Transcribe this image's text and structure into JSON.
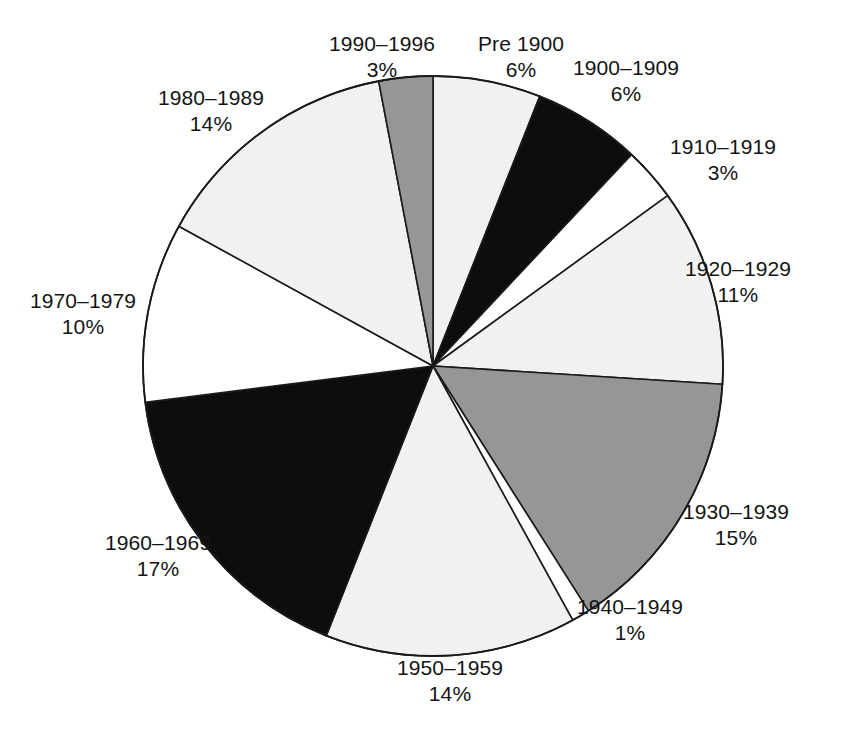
{
  "chart_data": {
    "type": "pie",
    "title": "",
    "subtitle": "",
    "xlabel": "",
    "ylabel": "",
    "legend_position": "none",
    "grid": false,
    "units": "percent",
    "start_angle_deg": 0,
    "direction": "clockwise",
    "categories": [
      "Pre 1900",
      "1900–1909",
      "1910–1919",
      "1920–1929",
      "1930–1939",
      "1940–1949",
      "1950–1959",
      "1960–1969",
      "1970–1979",
      "1980–1989",
      "1990–1996"
    ],
    "values": [
      6,
      6,
      3,
      11,
      15,
      1,
      14,
      17,
      10,
      14,
      3
    ],
    "value_labels": [
      "6%",
      "6%",
      "3%",
      "11%",
      "15%",
      "1%",
      "14%",
      "17%",
      "10%",
      "14%",
      "3%"
    ],
    "slice_colors": [
      "#f1f1ef",
      "#0d0d0d",
      "#ffffff",
      "#f1f1ef",
      "#969696",
      "#ffffff",
      "#f1f1ef",
      "#0d0d0d",
      "#ffffff",
      "#f1f1ef",
      "#969696"
    ],
    "slice_outline_color": "#1a1a1a",
    "slices": [
      {
        "label": "Pre 1900",
        "value": 6,
        "value_label": "6%",
        "color": "#f1f1ef",
        "label_x": 521,
        "label_y": 31
      },
      {
        "label": "1900–1909",
        "value": 6,
        "value_label": "6%",
        "color": "#0d0d0d",
        "label_x": 626,
        "label_y": 55
      },
      {
        "label": "1910–1919",
        "value": 3,
        "value_label": "3%",
        "color": "#ffffff",
        "label_x": 723,
        "label_y": 134
      },
      {
        "label": "1920–1929",
        "value": 11,
        "value_label": "11%",
        "color": "#f1f1ef",
        "label_x": 738,
        "label_y": 256
      },
      {
        "label": "1930–1939",
        "value": 15,
        "value_label": "15%",
        "color": "#969696",
        "label_x": 736,
        "label_y": 499
      },
      {
        "label": "1940–1949",
        "value": 1,
        "value_label": "1%",
        "color": "#ffffff",
        "label_x": 630,
        "label_y": 594
      },
      {
        "label": "1950–1959",
        "value": 14,
        "value_label": "14%",
        "color": "#f1f1ef",
        "label_x": 450,
        "label_y": 655
      },
      {
        "label": "1960–1969",
        "value": 17,
        "value_label": "17%",
        "color": "#0d0d0d",
        "label_x": 158,
        "label_y": 530
      },
      {
        "label": "1970–1979",
        "value": 10,
        "value_label": "10%",
        "color": "#ffffff",
        "label_x": 83,
        "label_y": 288
      },
      {
        "label": "1980–1989",
        "value": 14,
        "value_label": "14%",
        "color": "#f1f1ef",
        "label_x": 211,
        "label_y": 85
      },
      {
        "label": "1990–1996",
        "value": 3,
        "value_label": "3%",
        "color": "#969696",
        "label_x": 382,
        "label_y": 31
      }
    ],
    "geometry": {
      "center_x": 433,
      "center_y": 366,
      "radius": 290
    }
  }
}
